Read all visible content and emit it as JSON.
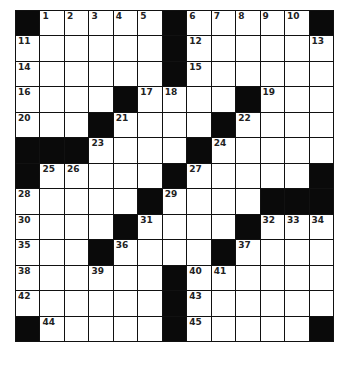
{
  "puzzle": {
    "rows": 13,
    "cols": 13,
    "colors": {
      "block": "#0a0a0a",
      "cell": "#ffffff",
      "line": "#111111"
    },
    "grid": [
      [
        "#",
        "1",
        "2",
        "3",
        "4",
        "5",
        "#",
        "6",
        "7",
        "8",
        "9",
        "10",
        "#"
      ],
      [
        "11",
        "",
        "",
        "",
        "",
        "",
        "#",
        "12",
        "",
        "",
        "",
        "",
        "13"
      ],
      [
        "14",
        "",
        "",
        "",
        "",
        "",
        "#",
        "15",
        "",
        "",
        "",
        "",
        ""
      ],
      [
        "16",
        "",
        "",
        "",
        "#",
        "17",
        "18",
        "",
        "",
        "#",
        "19",
        "",
        ""
      ],
      [
        "20",
        "",
        "",
        "#",
        "21",
        "",
        "",
        "",
        "#",
        "22",
        "",
        "",
        ""
      ],
      [
        "#",
        "#",
        "#",
        "23",
        "",
        "",
        "",
        "#",
        "24",
        "",
        "",
        "",
        ""
      ],
      [
        "#",
        "25",
        "26",
        "",
        "",
        "",
        "#",
        "27",
        "",
        "",
        "",
        "",
        "#"
      ],
      [
        "28",
        "",
        "",
        "",
        "",
        "#",
        "29",
        "",
        "",
        "",
        "#",
        "#",
        "#"
      ],
      [
        "30",
        "",
        "",
        "",
        "#",
        "31",
        "",
        "",
        "",
        "#",
        "32",
        "33",
        "34"
      ],
      [
        "35",
        "",
        "",
        "#",
        "36",
        "",
        "",
        "",
        "#",
        "37",
        "",
        "",
        ""
      ],
      [
        "38",
        "",
        "",
        "39",
        "",
        "",
        "#",
        "40",
        "41",
        "",
        "",
        "",
        ""
      ],
      [
        "42",
        "",
        "",
        "",
        "",
        "",
        "#",
        "43",
        "",
        "",
        "",
        "",
        ""
      ],
      [
        "#",
        "44",
        "",
        "",
        "",
        "",
        "#",
        "45",
        "",
        "",
        "",
        "",
        "#"
      ]
    ]
  }
}
